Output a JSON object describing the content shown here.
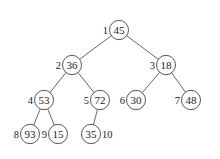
{
  "title": "",
  "diagram": {
    "type": "binary-tree-heap",
    "nodes": [
      {
        "index": "1",
        "value": "45",
        "x": 119,
        "y": 30,
        "label_side": "left"
      },
      {
        "index": "2",
        "value": "36",
        "x": 72,
        "y": 65,
        "label_side": "left"
      },
      {
        "index": "3",
        "value": "18",
        "x": 166,
        "y": 65,
        "label_side": "left"
      },
      {
        "index": "4",
        "value": "53",
        "x": 44,
        "y": 100,
        "label_side": "left"
      },
      {
        "index": "5",
        "value": "72",
        "x": 100,
        "y": 100,
        "label_side": "left"
      },
      {
        "index": "6",
        "value": "30",
        "x": 136,
        "y": 100,
        "label_side": "left"
      },
      {
        "index": "7",
        "value": "48",
        "x": 191,
        "y": 100,
        "label_side": "left"
      },
      {
        "index": "8",
        "value": "93",
        "x": 30,
        "y": 134,
        "label_side": "left"
      },
      {
        "index": "9",
        "value": "15",
        "x": 58,
        "y": 134,
        "label_side": "left"
      },
      {
        "index": "10",
        "value": "35",
        "x": 91,
        "y": 134,
        "label_side": "right"
      }
    ],
    "edges": [
      [
        "1",
        "2"
      ],
      [
        "1",
        "3"
      ],
      [
        "2",
        "4"
      ],
      [
        "2",
        "5"
      ],
      [
        "3",
        "6"
      ],
      [
        "3",
        "7"
      ],
      [
        "4",
        "8"
      ],
      [
        "4",
        "9"
      ],
      [
        "5",
        "10"
      ]
    ],
    "node_radius": 9.5
  }
}
